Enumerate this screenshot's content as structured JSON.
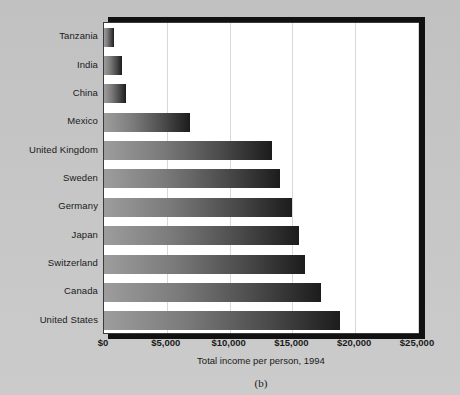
{
  "figure": {
    "caption": "(b)"
  },
  "chart_data": {
    "type": "bar",
    "orientation": "horizontal",
    "title": "",
    "xlabel": "Total income per person, 1994",
    "ylabel": "",
    "xlim": [
      0,
      25000
    ],
    "xticks": [
      0,
      5000,
      10000,
      15000,
      20000,
      25000
    ],
    "xticklabels": [
      "$0",
      "$5,000",
      "$10,000",
      "$15,000",
      "$20,000",
      "$25,000"
    ],
    "grid": "vertical",
    "legend": "none",
    "categories": [
      "Tanzania",
      "India",
      "China",
      "Mexico",
      "United Kingdom",
      "Sweden",
      "Germany",
      "Japan",
      "Switzerland",
      "Canada",
      "United States"
    ],
    "values": [
      770,
      1400,
      1750,
      6850,
      13400,
      14050,
      14950,
      15500,
      16000,
      17300,
      18750
    ],
    "bar_gradient": {
      "from": "#9d9d9d",
      "to": "#1c1c1c"
    },
    "colors": {
      "background": "#c9c9c9",
      "plot_background": "#ffffff",
      "gridline": "#d8d8d8",
      "frame": "#3a3a3a",
      "shadow": "#111111",
      "text": "#1a1a1a"
    }
  }
}
